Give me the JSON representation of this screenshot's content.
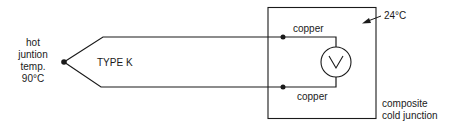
{
  "diagram": {
    "hot_junction": {
      "lines": [
        "hot",
        "juntion",
        "temp.",
        "90°C"
      ]
    },
    "thermocouple_label": "TYPE K",
    "wires": {
      "upper_label": "copper",
      "lower_label": "copper"
    },
    "meter": {
      "symbol": "V"
    },
    "cold_junction": {
      "temperature": "24°C",
      "label_lines": [
        "composite",
        "cold junction"
      ]
    },
    "colors": {
      "line": "#1a1a1a",
      "background": "#ffffff"
    }
  }
}
